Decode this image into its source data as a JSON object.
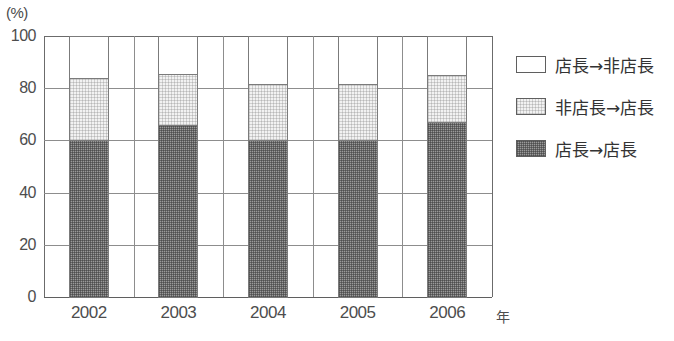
{
  "chart_data": {
    "type": "bar",
    "subtype": "stacked-bar-100",
    "title": "",
    "xlabel": "年",
    "ylabel": "(%)",
    "ylim": [
      0,
      100
    ],
    "yticks": [
      0,
      20,
      40,
      60,
      80,
      100
    ],
    "ytick_labels": [
      "0",
      "20",
      "40",
      "60",
      "80",
      "100"
    ],
    "grid": true,
    "legend_position": "right",
    "categories": [
      "2002",
      "2003",
      "2004",
      "2005",
      "2006"
    ],
    "series": [
      {
        "name": "店長→店長",
        "fill": "dark-gray-dither",
        "color": "#8f8f8f",
        "values": [
          60,
          66,
          60,
          60,
          67
        ]
      },
      {
        "name": "非店長→店長",
        "fill": "light-gray-dither",
        "color": "#ececec",
        "values": [
          24,
          19.5,
          21.5,
          21.5,
          18
        ]
      },
      {
        "name": "店長→非店長",
        "fill": "white",
        "color": "#ffffff",
        "values": [
          16,
          14.5,
          18.5,
          18.5,
          15
        ]
      }
    ],
    "cumulative_tops": {
      "dark": [
        60,
        66,
        60,
        60,
        67
      ],
      "dark_plus_light": [
        84,
        85.5,
        81.5,
        81.5,
        85
      ]
    }
  },
  "axes": {
    "y_unit_label": "(%)",
    "x_unit_label": "年"
  },
  "legend": {
    "items": [
      {
        "label": "店長→非店長",
        "swatch": "white"
      },
      {
        "label": "非店長→店長",
        "swatch": "light"
      },
      {
        "label": "店長→店長",
        "swatch": "dark"
      }
    ]
  },
  "colors": {
    "dark_fill": "#8f8f8f",
    "light_fill": "#ececec",
    "white_fill": "#ffffff",
    "grid": "#8d8d8d",
    "axis": "#5f5f5f",
    "text": "#4d4d4d"
  }
}
